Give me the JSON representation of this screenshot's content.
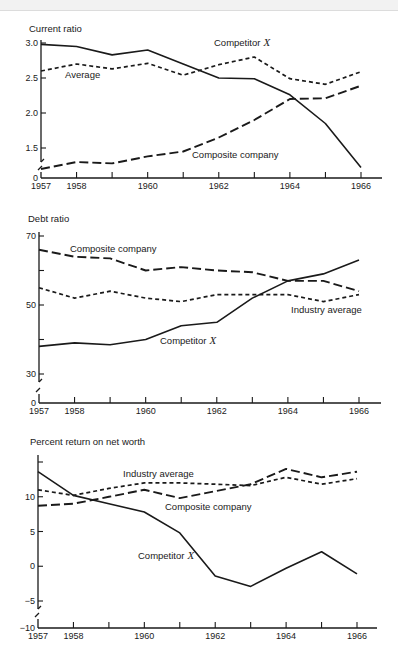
{
  "chart_data": [
    {
      "type": "line",
      "title": "Current ratio",
      "xlabel": "",
      "ylabel": "Current ratio",
      "x": [
        1957,
        1958,
        1959,
        1960,
        1961,
        1962,
        1963,
        1964,
        1965,
        1966
      ],
      "xtick_labels": [
        "1957",
        "1958",
        "",
        "1960",
        "",
        "1962",
        "",
        "1964",
        "",
        "1966"
      ],
      "ylim": [
        0,
        3.0
      ],
      "axis_break": true,
      "ytick_values": [
        0,
        1.5,
        2.0,
        2.5,
        3.0
      ],
      "ytick_labels": [
        "0",
        "1.5",
        "2.0",
        "2.5",
        "3.0"
      ],
      "grid": false,
      "series": [
        {
          "name": "Competitor X",
          "style": "solid",
          "values": [
            2.98,
            2.95,
            2.83,
            2.9,
            2.7,
            2.5,
            2.49,
            2.26,
            1.85,
            1.22
          ]
        },
        {
          "name": "Average",
          "style": "short-dash",
          "values": [
            2.6,
            2.7,
            2.63,
            2.71,
            2.54,
            2.69,
            2.8,
            2.49,
            2.41,
            2.59
          ]
        },
        {
          "name": "Composite company",
          "style": "long-dash",
          "values": [
            1.2,
            1.3,
            1.28,
            1.38,
            1.45,
            1.65,
            1.9,
            2.2,
            2.21,
            2.39
          ]
        }
      ],
      "annotations": [
        {
          "text": "Competitor",
          "italic_suffix": "X",
          "series": "Competitor X"
        },
        {
          "text": "Average",
          "series": "Average"
        },
        {
          "text": "Composite company",
          "series": "Composite company"
        }
      ]
    },
    {
      "type": "line",
      "title": "Debt ratio",
      "xlabel": "",
      "ylabel": "Debt ratio",
      "x": [
        1957,
        1958,
        1959,
        1960,
        1961,
        1962,
        1963,
        1964,
        1965,
        1966
      ],
      "xtick_labels": [
        "1957",
        "1958",
        "",
        "1960",
        "",
        "1962",
        "",
        "1964",
        "",
        "1966"
      ],
      "ylim": [
        0,
        70
      ],
      "axis_break": true,
      "ytick_values": [
        0,
        30,
        40,
        50,
        60,
        70
      ],
      "ytick_labels": [
        "0",
        "30",
        "",
        "50",
        "",
        "70"
      ],
      "grid": false,
      "series": [
        {
          "name": "Composite company",
          "style": "long-dash",
          "values": [
            66,
            64,
            63.5,
            60,
            61,
            60,
            59.5,
            57,
            57,
            54
          ]
        },
        {
          "name": "Industry average",
          "style": "short-dash",
          "values": [
            55,
            52,
            54,
            52,
            51,
            53,
            53,
            53,
            51,
            53
          ]
        },
        {
          "name": "Competitor X",
          "style": "solid",
          "values": [
            38,
            39,
            38.5,
            40,
            44,
            45,
            52,
            57,
            59,
            63
          ]
        }
      ],
      "annotations": [
        {
          "text": "Composite company",
          "series": "Composite company"
        },
        {
          "text": "Industry average",
          "series": "Industry average"
        },
        {
          "text": "Competitor",
          "italic_suffix": "X",
          "series": "Competitor X"
        }
      ]
    },
    {
      "type": "line",
      "title": "Percent return on net worth",
      "xlabel": "",
      "ylabel": "Percent return on net worth",
      "x": [
        1957,
        1958,
        1959,
        1960,
        1961,
        1962,
        1963,
        1964,
        1965,
        1966
      ],
      "xtick_labels": [
        "1957",
        "1958",
        "",
        "1960",
        "",
        "1962",
        "",
        "1964",
        "",
        "1966"
      ],
      "ylim": [
        -10,
        15
      ],
      "axis_break": true,
      "ytick_values": [
        -10,
        -5,
        0,
        5,
        10,
        15
      ],
      "ytick_labels": [
        "−10",
        "−5",
        "0",
        "5",
        "10",
        ""
      ],
      "grid": false,
      "series": [
        {
          "name": "Industry average",
          "style": "short-dash",
          "values": [
            11,
            10.2,
            11.2,
            12,
            12,
            11.8,
            11.6,
            12.8,
            11.8,
            12.6
          ]
        },
        {
          "name": "Composite company",
          "style": "long-dash",
          "values": [
            8.7,
            9,
            10,
            11,
            9.8,
            10.8,
            11.8,
            14,
            12.8,
            13.6
          ]
        },
        {
          "name": "Competitor X",
          "style": "solid",
          "values": [
            13.6,
            10.2,
            9,
            7.8,
            4.8,
            -1.4,
            -2.9,
            -0.3,
            2.1,
            -1.1
          ]
        }
      ],
      "annotations": [
        {
          "text": "Industry average",
          "series": "Industry average"
        },
        {
          "text": "Composite company",
          "series": "Composite company"
        },
        {
          "text": "Competitor",
          "italic_suffix": "X",
          "series": "Competitor X"
        }
      ]
    }
  ]
}
